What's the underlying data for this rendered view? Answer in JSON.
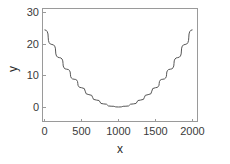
{
  "chart_data": {
    "type": "line",
    "title": "",
    "subtitle": "",
    "xlabel": "x",
    "ylabel": "y",
    "xlim": [
      0,
      2100
    ],
    "ylim": [
      -3,
      32
    ],
    "xticks": [
      0,
      500,
      1000,
      1500,
      2000
    ],
    "xtick_labels": [
      "0",
      "500",
      "1000",
      "1500",
      "2000"
    ],
    "yticks": [
      0,
      10,
      20,
      30
    ],
    "ytick_labels": [
      "0",
      "10",
      "20",
      "30"
    ],
    "grid": false,
    "legend": null,
    "annotations": [],
    "series": [
      {
        "name": "parabola",
        "color": "#555555",
        "x": [
          0,
          100,
          200,
          300,
          400,
          500,
          600,
          700,
          800,
          900,
          1000,
          1100,
          1200,
          1300,
          1400,
          1500,
          1600,
          1700,
          1800,
          1900,
          2000
        ],
        "y": [
          24.5,
          19.85,
          15.68,
          12.0,
          8.82,
          6.13,
          3.92,
          2.21,
          0.98,
          0.25,
          0.0,
          0.25,
          0.98,
          2.21,
          3.92,
          6.13,
          8.82,
          12.0,
          15.68,
          19.85,
          24.5
        ]
      }
    ]
  },
  "axes": {
    "x_title": "x",
    "y_title": "y"
  }
}
